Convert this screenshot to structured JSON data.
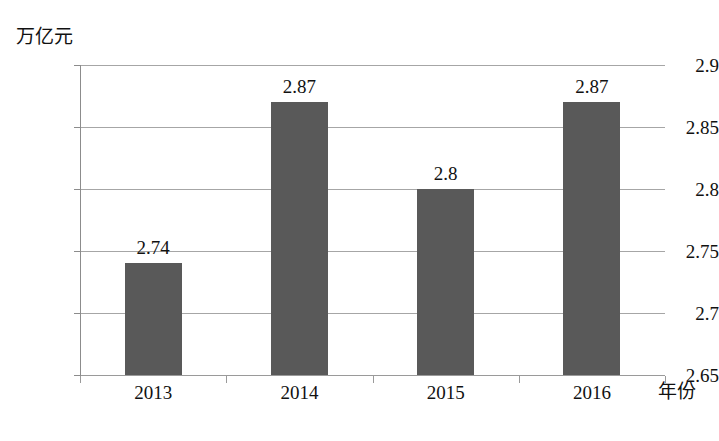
{
  "chart_data": {
    "type": "bar",
    "title": "",
    "subtitle": "",
    "xlabel": "年份",
    "ylabel": "万亿元",
    "categories": [
      "2013",
      "2014",
      "2015",
      "2016"
    ],
    "values": [
      2.74,
      2.87,
      2.8,
      2.87
    ],
    "value_labels": [
      "2.74",
      "2.87",
      "2.8",
      "2.87"
    ],
    "series": [
      {
        "name": "",
        "values": [
          2.74,
          2.87,
          2.8,
          2.87
        ]
      }
    ],
    "ylim": [
      2.65,
      2.9
    ],
    "ytick_labels": [
      "2.9",
      "2.85",
      "2.8",
      "2.75",
      "2.7",
      "2.65"
    ],
    "ytick_values": [
      2.9,
      2.85,
      2.8,
      2.75,
      2.7,
      2.65
    ],
    "grid": true,
    "legend": false,
    "legend_position": "none",
    "bar_color": "#595959",
    "gridline_color": "#a6a6a6",
    "axis_color": "#8c8c8c",
    "background_color": "#ffffff"
  }
}
